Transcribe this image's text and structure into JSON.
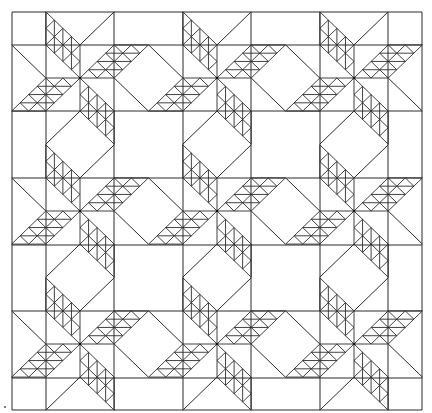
{
  "diagram": {
    "type": "quilt-pattern",
    "width": 432,
    "height": 413,
    "background": "#ffffff",
    "line_color": "#2b2b2b",
    "grid_x": [
      12,
      46,
      114,
      183,
      251,
      320,
      388,
      422
    ],
    "grid_y": [
      12,
      45,
      111,
      178,
      245,
      311,
      378,
      410
    ],
    "star_centers_x": [
      80,
      217,
      354
    ],
    "star_centers_y": [
      78,
      211,
      344
    ],
    "unit_u": 34.2,
    "unit_v": 33.1,
    "arm_divisions_long": 4,
    "arm_divisions_wide": 2,
    "stars": 9,
    "stray_dot": [
      5,
      407
    ]
  }
}
